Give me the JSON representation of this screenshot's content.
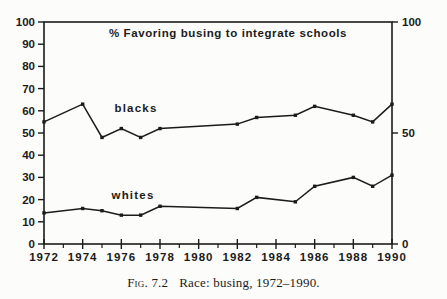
{
  "figure": {
    "caption_label": "Fig. 7.2",
    "caption_text": "Race: busing, 1972–1990."
  },
  "colors": {
    "ink": "#1b1b1b",
    "paper": "#fcfcfa"
  },
  "chart_data": {
    "type": "line",
    "title": "% Favoring busing to integrate schools",
    "x": [
      1972,
      1974,
      1975,
      1976,
      1977,
      1978,
      1982,
      1983,
      1985,
      1986,
      1988,
      1989,
      1990
    ],
    "series": [
      {
        "name": "blacks",
        "values": [
          55,
          63,
          48,
          52,
          48,
          52,
          54,
          57,
          58,
          62,
          58,
          55,
          63
        ],
        "label_px": [
          136,
          112
        ]
      },
      {
        "name": "whites",
        "values": [
          14,
          16,
          15,
          13,
          13,
          17,
          16,
          21,
          19,
          26,
          30,
          26,
          31
        ],
        "label_px": [
          133,
          199
        ]
      }
    ],
    "xlim": [
      1972,
      1990
    ],
    "ylim": [
      0,
      100
    ],
    "y_ticks_left": [
      0,
      10,
      20,
      30,
      40,
      50,
      60,
      70,
      80,
      90,
      100
    ],
    "y_ticks_right": [
      0,
      50,
      100
    ],
    "x_ticks_major": [
      1972,
      1974,
      1976,
      1978,
      1980,
      1982,
      1984,
      1986,
      1988,
      1990
    ],
    "x_ticks_minor": [
      1973,
      1975,
      1977,
      1979,
      1981,
      1983,
      1985,
      1987,
      1989
    ],
    "grid": false,
    "legend_position": "inline-labels",
    "marker": "square"
  }
}
